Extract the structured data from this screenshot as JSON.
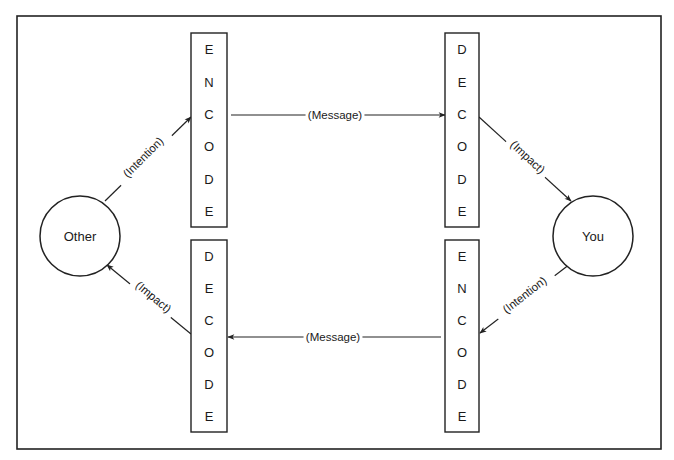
{
  "diagram": {
    "title": "",
    "frame": {
      "x": 17,
      "y": 16,
      "width": 644,
      "height": 433
    },
    "nodes": [
      {
        "id": "other",
        "label": "Other",
        "shape": "circle",
        "cx": 80,
        "cy": 236,
        "r": 40
      },
      {
        "id": "you",
        "label": "You",
        "shape": "circle",
        "cx": 593,
        "cy": 236,
        "r": 40
      }
    ],
    "boxes": [
      {
        "id": "top_left_encode",
        "word": "ENCODE",
        "letters": [
          "E",
          "N",
          "C",
          "O",
          "D",
          "E"
        ],
        "x": 191,
        "y": 33,
        "width": 36,
        "height": 194
      },
      {
        "id": "top_right_decode",
        "word": "DECODE",
        "letters": [
          "D",
          "E",
          "C",
          "O",
          "D",
          "E"
        ],
        "x": 445,
        "y": 33,
        "width": 34,
        "height": 194
      },
      {
        "id": "bottom_left_decode",
        "word": "DECODE",
        "letters": [
          "D",
          "E",
          "C",
          "O",
          "D",
          "E"
        ],
        "x": 191,
        "y": 240,
        "width": 36,
        "height": 192
      },
      {
        "id": "bottom_right_encode",
        "word": "ENCODE",
        "letters": [
          "E",
          "N",
          "C",
          "O",
          "D",
          "E"
        ],
        "x": 445,
        "y": 240,
        "width": 34,
        "height": 192
      }
    ],
    "edges": [
      {
        "from": "other",
        "to": "top_left_encode",
        "label": "(Intention)",
        "x1": 105,
        "y1": 201,
        "x2": 191,
        "y2": 117,
        "label_x": 146,
        "label_y": 160,
        "label_angle": -45
      },
      {
        "from": "top_left_encode",
        "to": "top_right_decode",
        "label": "(Message)",
        "x1": 231,
        "y1": 115,
        "x2": 445,
        "y2": 115,
        "label_x": 335,
        "label_y": 119,
        "label_angle": 0
      },
      {
        "from": "top_right_decode",
        "to": "you",
        "label": "(Impact)",
        "x1": 479,
        "y1": 117,
        "x2": 571,
        "y2": 201,
        "label_x": 525,
        "label_y": 160,
        "label_angle": 43
      },
      {
        "from": "you",
        "to": "bottom_right_encode",
        "label": "(Intention)",
        "x1": 570,
        "y1": 264,
        "x2": 480,
        "y2": 333,
        "label_x": 527,
        "label_y": 298,
        "label_angle": -38
      },
      {
        "from": "bottom_right_encode",
        "to": "bottom_left_decode",
        "label": "(Message)",
        "x1": 441,
        "y1": 337,
        "x2": 228,
        "y2": 337,
        "label_x": 333,
        "label_y": 341,
        "label_angle": 0
      },
      {
        "from": "bottom_left_decode",
        "to": "other",
        "label": "(Impact)",
        "x1": 191,
        "y1": 334,
        "x2": 107,
        "y2": 265,
        "label_x": 151,
        "label_y": 300,
        "label_angle": 40
      }
    ]
  }
}
